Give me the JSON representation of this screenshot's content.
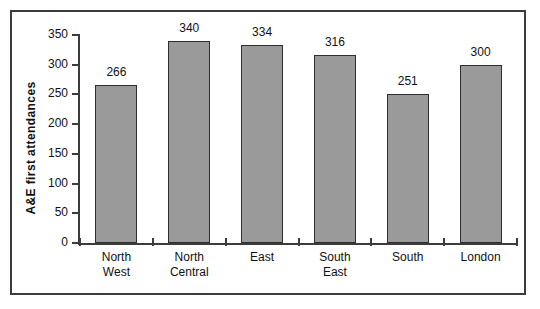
{
  "chart_data": {
    "type": "bar",
    "title": "",
    "xlabel": "",
    "ylabel": "A&E  first  attendances",
    "categories": [
      "North West",
      "North Central",
      "East",
      "South East",
      "South",
      "London"
    ],
    "category_lines": [
      [
        "North",
        "West"
      ],
      [
        "North",
        "Central"
      ],
      [
        "East",
        ""
      ],
      [
        "South",
        "East"
      ],
      [
        "South",
        ""
      ],
      [
        "London",
        ""
      ]
    ],
    "values": [
      266,
      340,
      334,
      316,
      251,
      300
    ],
    "value_labels": [
      "266",
      "340",
      "334",
      "316",
      "251",
      "300"
    ],
    "ylim": [
      0,
      350
    ],
    "yticks": [
      0,
      50,
      100,
      150,
      200,
      250,
      300,
      350
    ],
    "ytick_labels": [
      "0",
      "50",
      "100",
      "150",
      "200",
      "250",
      "300",
      "350"
    ],
    "grid": false,
    "legend": false,
    "bar_color": "#9a9a9a",
    "bar_border_color": "#2e2e2e",
    "axis_color": "#3c3c3c",
    "text_color": "#111111",
    "background_color": "#ffffff",
    "frame_border_color": "#3c3c3c"
  }
}
